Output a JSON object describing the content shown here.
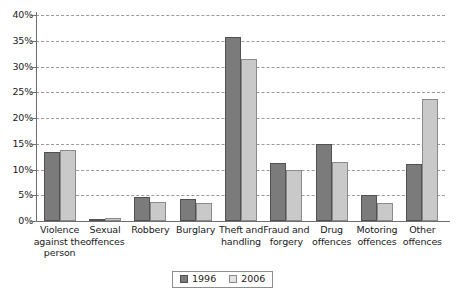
{
  "chart_data": {
    "type": "bar",
    "title": "",
    "subtitle": "",
    "xlabel": "",
    "ylabel": "",
    "ylim": [
      0,
      40
    ],
    "ytick_labels": [
      "0%",
      "5%",
      "10%",
      "15%",
      "20%",
      "25%",
      "30%",
      "35%",
      "40%"
    ],
    "ytick_values": [
      0,
      5,
      10,
      15,
      20,
      25,
      30,
      35,
      40
    ],
    "grid": true,
    "grid_style": "dashed-horizontal",
    "legend_position": "bottom-center",
    "categories": [
      "Violence against the person",
      "Sexual offences",
      "Robbery",
      "Burglary",
      "Theft and handling",
      "Fraud and forgery",
      "Drug offences",
      "Motoring offences",
      "Other offences"
    ],
    "category_lines": [
      [
        "Violence",
        "against the",
        "person"
      ],
      [
        "Sexual",
        "offences"
      ],
      [
        "Robbery"
      ],
      [
        "Burglary"
      ],
      [
        "Theft and",
        "handling"
      ],
      [
        "Fraud and",
        "forgery"
      ],
      [
        "Drug",
        "offences"
      ],
      [
        "Motoring",
        "offences"
      ],
      [
        "Other",
        "offences"
      ]
    ],
    "series": [
      {
        "name": "1996",
        "color": "#7b7b7b",
        "values": [
          13.4,
          0.4,
          4.6,
          4.2,
          35.7,
          11.2,
          15.0,
          5.1,
          11.0
        ]
      },
      {
        "name": "2006",
        "color": "#c9c9c9",
        "values": [
          13.7,
          0.6,
          3.7,
          3.5,
          31.5,
          10.0,
          11.5,
          3.5,
          23.7
        ]
      }
    ]
  },
  "legend": {
    "items": [
      {
        "label": "1996"
      },
      {
        "label": "2006"
      }
    ]
  },
  "colors": {
    "series_1996": "#7b7b7b",
    "series_2006": "#c9c9c9",
    "axis": "#6e6e6e",
    "grid": "#9b9b9b",
    "background": "#ffffff"
  }
}
